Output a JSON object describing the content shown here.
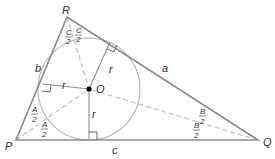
{
  "diagram": {
    "vertices": {
      "P": {
        "label": "P",
        "x": 16,
        "y": 140
      },
      "Q": {
        "label": "Q",
        "x": 258,
        "y": 140
      },
      "R": {
        "label": "R",
        "x": 67,
        "y": 17
      }
    },
    "incenter": {
      "label": "O",
      "x": 89,
      "y": 89
    },
    "inradius": {
      "label": "r",
      "value_px": 51
    },
    "sides": {
      "a": "a",
      "b": "b",
      "c": "c"
    },
    "half_angles": {
      "A_num": "A",
      "A_den": "2",
      "B_num": "B",
      "B_den": "2",
      "C_num": "C",
      "C_den": "2"
    },
    "radius_labels": [
      "r",
      "r",
      "r"
    ],
    "colors": {
      "triangle": "#8c8c8c",
      "circle": "#b0b0b0",
      "bisector": "#c0c0c0",
      "radius": "#8c8c8c",
      "center_dot": "#000000",
      "text": "#333333"
    }
  }
}
